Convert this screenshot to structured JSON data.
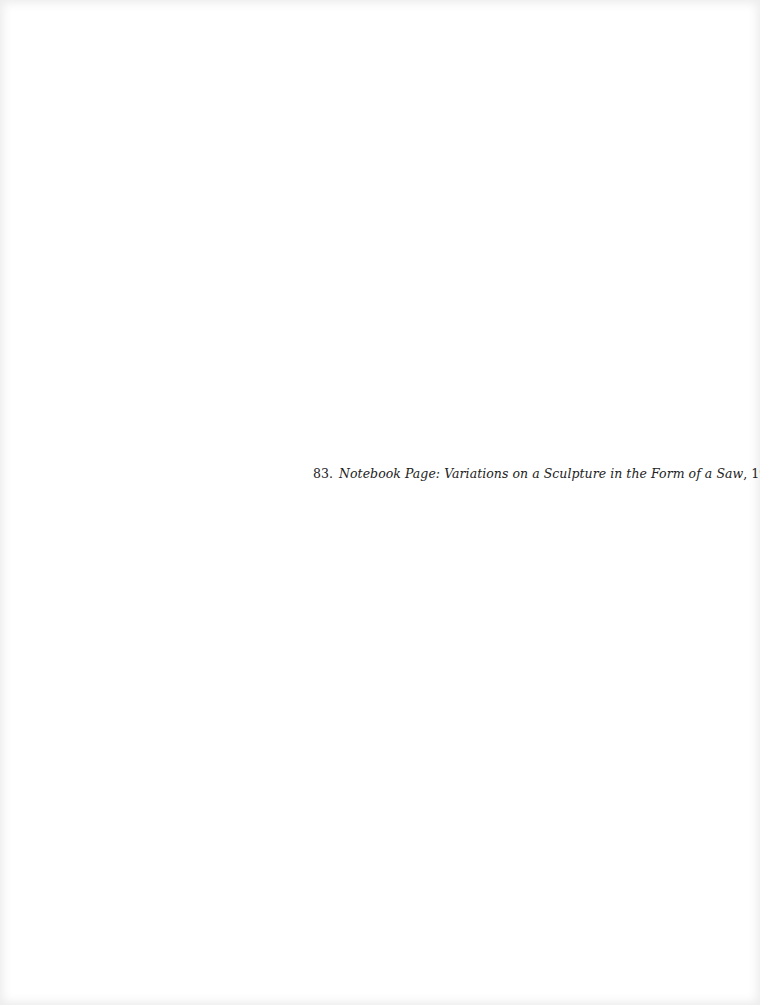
{
  "caption": {
    "number": "83.",
    "title": "Notebook Page: Variations on a Sculpture in the Form of a Saw",
    "separator": ",",
    "year": " 1994"
  }
}
